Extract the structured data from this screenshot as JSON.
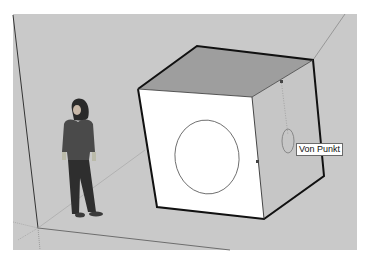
{
  "app": "SketchUp 3D modeling viewport",
  "viewport": {
    "background": "#c9c9c9",
    "tooltip": {
      "label": "Von Punkt"
    },
    "model": {
      "cube": {
        "top_face_color": "#9e9e9e",
        "front_face_color": "#ffffff",
        "right_face_color": "#c6c6c6",
        "edge_color": "#111111"
      },
      "circle_on_front_face": {
        "stroke": "#555555"
      },
      "inference_ellipse": {
        "stroke": "#777777"
      },
      "figure": {
        "name": "scale-figure-person"
      }
    }
  }
}
